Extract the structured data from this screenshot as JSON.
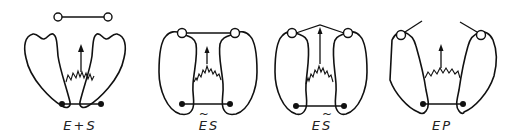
{
  "figure": {
    "stroke_color": "#111111",
    "background": "#ffffff"
  },
  "panels": [
    {
      "id": "E+S",
      "label_parts": [
        {
          "text": "E",
          "tilde": false
        },
        {
          "text": "+",
          "tilde": false
        },
        {
          "text": "S",
          "tilde": false
        }
      ],
      "label_text": "E + S",
      "center_x": 75,
      "substrate": "free-dumbbell",
      "enzyme_state": "open",
      "spring": "relaxed"
    },
    {
      "id": "~ES",
      "label_parts": [
        {
          "text": "E",
          "tilde": true
        },
        {
          "text": "S",
          "tilde": false
        }
      ],
      "label_text": "ẼS",
      "center_x": 208,
      "substrate": "bound-straight",
      "enzyme_state": "closed-strained-enzyme",
      "spring": "stretched"
    },
    {
      "id": "E~S",
      "label_parts": [
        {
          "text": "E",
          "tilde": false
        },
        {
          "text": "S",
          "tilde": true
        }
      ],
      "label_text": "ES̃",
      "center_x": 320,
      "substrate": "bound-bent",
      "enzyme_state": "closed",
      "spring": "stretched"
    },
    {
      "id": "EP",
      "label_parts": [
        {
          "text": "E",
          "tilde": false
        },
        {
          "text": "P",
          "tilde": false
        }
      ],
      "label_text": "EP",
      "center_x": 441,
      "substrate": "product-split",
      "enzyme_state": "open",
      "spring": "relaxed"
    }
  ]
}
